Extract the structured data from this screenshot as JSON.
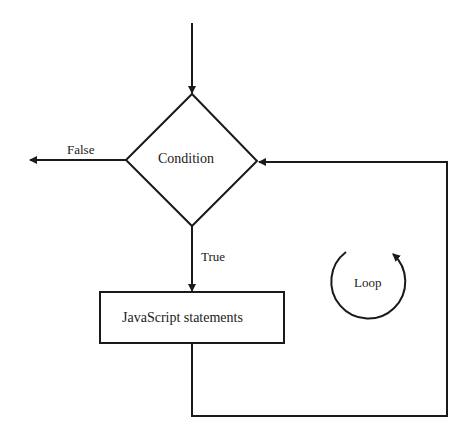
{
  "diagram": {
    "type": "flowchart",
    "title": "",
    "nodes": {
      "condition": {
        "shape": "diamond",
        "label": "Condition"
      },
      "statements": {
        "shape": "rectangle",
        "label": "JavaScript statements"
      },
      "loop": {
        "shape": "circular-arrow",
        "label": "Loop"
      }
    },
    "edges": {
      "entry": {
        "from": "start",
        "to": "condition",
        "label": ""
      },
      "false": {
        "from": "condition",
        "to": "exit",
        "label": "False"
      },
      "true": {
        "from": "condition",
        "to": "statements",
        "label": "True"
      },
      "back": {
        "from": "statements",
        "to": "condition",
        "label": ""
      }
    },
    "colors": {
      "stroke": "#1a1a1a",
      "background": "#ffffff"
    }
  }
}
